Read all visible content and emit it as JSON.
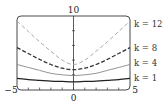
{
  "chart_data": {
    "type": "line",
    "title": "",
    "xlabel": "",
    "ylabel": "",
    "xlim": [
      -5,
      5
    ],
    "ylim": [
      0,
      10
    ],
    "x_tick_labels": [
      "-5",
      "0",
      "5"
    ],
    "y_tick_labels": [
      "10"
    ],
    "grid": false,
    "legend_position": "right (inline labels)",
    "x": [
      -5,
      -4,
      -3,
      -2,
      -1,
      0,
      1,
      2,
      3,
      4,
      5
    ],
    "series": [
      {
        "name": "k = 12",
        "style": "dashed-light",
        "color": "#a0a0a0",
        "values": [
          9.3,
          7.9,
          6.5,
          5.2,
          4.0,
          3.4,
          4.0,
          5.2,
          6.5,
          7.9,
          9.3
        ]
      },
      {
        "name": "k = 8",
        "style": "dashed-dark",
        "color": "#333333",
        "values": [
          5.7,
          4.9,
          4.1,
          3.4,
          2.9,
          2.7,
          2.9,
          3.4,
          4.1,
          4.9,
          5.7
        ]
      },
      {
        "name": "k = 4",
        "style": "solid-gray",
        "color": "#888888",
        "values": [
          3.4,
          3.0,
          2.6,
          2.2,
          2.0,
          1.9,
          2.0,
          2.2,
          2.6,
          3.0,
          3.4
        ]
      },
      {
        "name": "k = 1",
        "style": "solid-dark",
        "color": "#222222",
        "values": [
          1.5,
          1.35,
          1.25,
          1.15,
          1.1,
          1.05,
          1.1,
          1.15,
          1.25,
          1.35,
          1.5
        ]
      }
    ]
  },
  "labels": {
    "x_min": "−5",
    "x_zero": "0",
    "x_max": "5",
    "y_max": "10",
    "k12": "k = 12",
    "k8": "k = 8",
    "k4": "k = 4",
    "k1": "k = 1"
  }
}
